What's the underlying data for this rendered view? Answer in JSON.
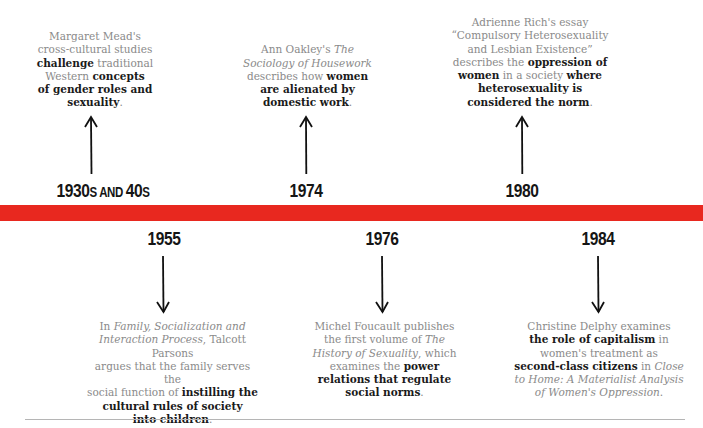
{
  "timeline": {
    "bar_color": "#e8281f",
    "above": [
      {
        "year": "1930s and 40s",
        "year_parts": {
          "a": "1930",
          "b": "s and ",
          "c": "40",
          "d": "s"
        },
        "segments": [
          {
            "t": "Margaret Mead's cross-cultural studies ",
            "s": "normal"
          },
          {
            "t": "challenge",
            "s": "bold"
          },
          {
            "t": " traditional Western ",
            "s": "normal"
          },
          {
            "t": "concepts of gender roles and sexuality",
            "s": "bold"
          },
          {
            "t": ".",
            "s": "normal"
          }
        ],
        "lines": [
          "Margaret Mead's",
          "cross-cultural studies",
          "challenge traditional",
          "Western concepts",
          "of gender roles and",
          "sexuality."
        ]
      },
      {
        "year": "1974",
        "lines": [
          "Ann Oakley's The",
          "Sociology of Housework",
          "describes how women",
          "are alienated by",
          "domestic work."
        ]
      },
      {
        "year": "1980",
        "lines": [
          "Adrienne Rich's essay",
          "“Compulsory Heterosexuality",
          "and Lesbian Existence”",
          "describes the oppression of",
          "women in a society where",
          "heterosexuality is",
          "considered the norm."
        ]
      }
    ],
    "below": [
      {
        "year": "1955",
        "lines": [
          "In Family, Socialization and",
          "Interaction Process, Talcott Parsons",
          "argues that the family serves the",
          "social function of instilling the",
          "cultural rules of society",
          "into children."
        ]
      },
      {
        "year": "1976",
        "lines": [
          "Michel Foucault publishes",
          "the first volume of The",
          "History of Sexuality, which",
          "examines the power",
          "relations that regulate",
          "social norms."
        ]
      },
      {
        "year": "1984",
        "lines": [
          "Christine Delphy examines",
          "the role of capitalism in",
          "women's treatment as",
          "second-class citizens in Close",
          "to Home: A Materialist Analysis",
          "of Women's Oppression."
        ]
      }
    ]
  },
  "y1930": {
    "a": "1930",
    "b": "s and ",
    "c": "40",
    "d": "s"
  },
  "y1974": "1974",
  "y1980": "1980",
  "y1955": "1955",
  "y1976": "1976",
  "y1984": "1984",
  "t": {
    "m1": "Margaret Mead's",
    "m2": "cross-cultural studies",
    "m3b": "challenge",
    "m3": " traditional",
    "m4": "Western ",
    "m4b": "concepts",
    "m5b": "of gender roles and",
    "m6b": "sexuality",
    "m6": ".",
    "o1": "Ann Oakley's ",
    "o1i": "The",
    "o2i": "Sociology of Housework",
    "o3": "describes how ",
    "o3b": "women",
    "o4b": "are alienated by",
    "o5b": "domestic work",
    "o5": ".",
    "r1": "Adrienne Rich's essay",
    "r2": "“Compulsory Heterosexuality",
    "r3": "and Lesbian Existence”",
    "r4": "describes the ",
    "r4b": "oppression of",
    "r5b": "women",
    "r5": " in a society ",
    "r5b2": "where",
    "r6b": "heterosexuality is",
    "r7b": "considered the norm",
    "r7": ".",
    "p1": "In ",
    "p1i": "Family, Socialization and",
    "p2i": "Interaction Process",
    "p2": ", Talcott Parsons",
    "p3": "argues that the family serves the",
    "p4": "social function of ",
    "p4b": "instilling the",
    "p5b": "cultural rules of society",
    "p6b": "into children",
    "p6": ".",
    "f1": "Michel Foucault publishes",
    "f2": "the first volume of ",
    "f2i": "The",
    "f3i": "History of Sexuality",
    "f3": ", which",
    "f4": "examines the ",
    "f4b": "power",
    "f5b": "relations that regulate",
    "f6b": "social norms",
    "f6": ".",
    "d1": "Christine Delphy examines",
    "d2b": "the role of capitalism",
    "d2": " in",
    "d3": "women's treatment as",
    "d4b": "second-class citizens",
    "d4": " in ",
    "d4i": "Close",
    "d5i": "to Home: A Materialist Analysis",
    "d6i": "of Women's Oppression",
    "d6": "."
  },
  "icons": {
    "up": "arrow-up-icon",
    "down": "arrow-down-icon"
  }
}
